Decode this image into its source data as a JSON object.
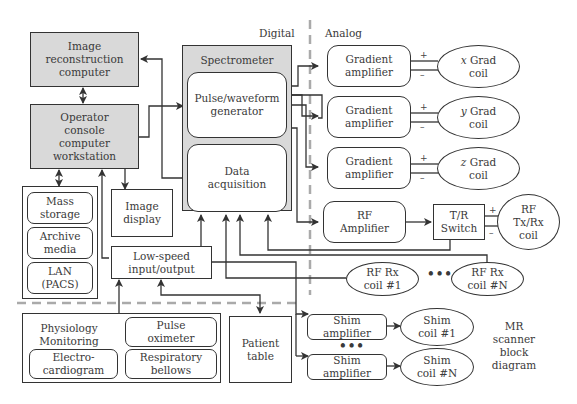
{
  "title": "MR scanner block diagram",
  "regions": {
    "digital": "Digital",
    "analog": "Analog"
  },
  "computers": {
    "image_recon": "Image\nreconstruction\ncomputer",
    "operator_console": "Operator\nconsole\ncomputer\nworkstation",
    "image_display": "Image\ndisplay"
  },
  "storage": {
    "mass_storage": "Mass\nstorage",
    "archive_media": "Archive\nmedia",
    "lan": "LAN\n(PACS)"
  },
  "spectrometer": {
    "title": "Spectrometer",
    "pulse_generator": "Pulse/waveform\ngenerator",
    "data_acquisition": "Data\nacquisition"
  },
  "low_speed_io": "Low-speed\ninput/output",
  "gradients": [
    {
      "amp": "Gradient\namplifier",
      "axis": "x",
      "coil": "Grad\ncoil"
    },
    {
      "amp": "Gradient\namplifier",
      "axis": "y",
      "coil": "Grad\ncoil"
    },
    {
      "amp": "Gradient\namplifier",
      "axis": "z",
      "coil": "Grad\ncoil"
    }
  ],
  "rf": {
    "amplifier": "RF\nAmplifier",
    "tr_switch": "T/R\nSwitch",
    "txrx_coil": "RF\nTx/Rx\ncoil",
    "rx_coil_1": "RF Rx\ncoil #1",
    "rx_coil_n": "RF Rx\ncoil #N",
    "ellipsis": "•••"
  },
  "polarity": {
    "plus": "+",
    "minus": "–"
  },
  "physiology": {
    "title": "Physiology\nMonitoring",
    "pulse_oximeter": "Pulse\noximeter",
    "ecg": "Electro-\ncardiogram",
    "respiratory": "Respiratory\nbellows"
  },
  "patient_table": "Patient\ntable",
  "shim": {
    "amp_1": "Shim\namplifier",
    "coil_1": "Shim\ncoil #1",
    "amp_n": "Shim\namplifier",
    "coil_n": "Shim\ncoil #N",
    "ellipsis": "•••"
  },
  "caption": "MR\nscanner\nblock\ndiagram",
  "colors": {
    "gray_fill": "#d9d9d9",
    "line": "#333333",
    "divider": "#aaaaaa"
  }
}
